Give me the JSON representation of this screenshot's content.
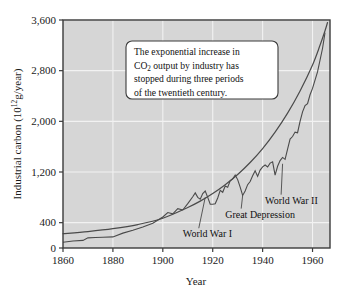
{
  "chart_data": {
    "type": "line",
    "title": "",
    "xlabel": "Year",
    "ylabel": "Industrial carbon (10^12 g/year)",
    "ylabel_parts": {
      "main": "Industrial carbon (10",
      "exponent": "12",
      "tail": "g/year)"
    },
    "xlim": [
      1860,
      1967
    ],
    "ylim": [
      0,
      3600
    ],
    "grid": true,
    "legend_position": "none",
    "x_ticks": [
      1860,
      1880,
      1900,
      1920,
      1940,
      1960
    ],
    "x_tick_labels": [
      "1860",
      "1880",
      "1900",
      "1920",
      "1940",
      "1960"
    ],
    "y_ticks": [
      0,
      400,
      1200,
      2000,
      2800,
      3600
    ],
    "y_tick_labels": [
      "0",
      "400",
      "1,200",
      "2,000",
      "2,800",
      "3,600"
    ],
    "series": [
      {
        "name": "exponential-trend",
        "style": "smooth",
        "x": [
          1860,
          1870,
          1880,
          1890,
          1900,
          1910,
          1915,
          1920,
          1925,
          1930,
          1935,
          1940,
          1945,
          1950,
          1955,
          1960,
          1963,
          1965,
          1966
        ],
        "values": [
          225,
          260,
          305,
          370,
          470,
          640,
          740,
          860,
          1000,
          1160,
          1350,
          1570,
          1830,
          2130,
          2480,
          2890,
          3200,
          3430,
          3560
        ]
      },
      {
        "name": "measured-industrial-carbon",
        "style": "jagged",
        "x": [
          1860,
          1864,
          1868,
          1870,
          1873,
          1876,
          1880,
          1884,
          1888,
          1892,
          1896,
          1900,
          1902,
          1904,
          1906,
          1908,
          1910,
          1912,
          1913,
          1914,
          1915,
          1916,
          1917,
          1918,
          1919,
          1920,
          1921,
          1922,
          1923,
          1924,
          1925,
          1926,
          1927,
          1928,
          1929,
          1930,
          1931,
          1932,
          1933,
          1934,
          1935,
          1936,
          1937,
          1938,
          1939,
          1940,
          1941,
          1942,
          1943,
          1944,
          1945,
          1946,
          1947,
          1948,
          1949,
          1950,
          1951,
          1952,
          1953,
          1954,
          1955,
          1956,
          1957,
          1958,
          1959,
          1960,
          1962,
          1964,
          1965
        ],
        "values": [
          90,
          110,
          120,
          160,
          165,
          170,
          175,
          235,
          280,
          330,
          390,
          490,
          560,
          540,
          620,
          600,
          700,
          810,
          870,
          800,
          770,
          860,
          900,
          800,
          690,
          690,
          700,
          790,
          910,
          880,
          980,
          960,
          1060,
          1090,
          1150,
          1080,
          960,
          830,
          900,
          1000,
          1050,
          1140,
          1220,
          1130,
          1230,
          1280,
          1310,
          1280,
          1340,
          1360,
          1150,
          1290,
          1380,
          1430,
          1400,
          1560,
          1720,
          1760,
          1830,
          1820,
          2000,
          2150,
          2250,
          2280,
          2420,
          2520,
          2780,
          3150,
          3400
        ]
      }
    ],
    "annotations": [
      {
        "name": "world-war-one",
        "label": "World War I",
        "label_x": 1908,
        "label_y": 170,
        "point_x": 1917,
        "point_y": 800
      },
      {
        "name": "great-depression",
        "label": "Great Depression",
        "label_x": 1925,
        "label_y": 480,
        "point_x": 1932,
        "point_y": 830
      },
      {
        "name": "world-war-two",
        "label": "World War II",
        "label_x": 1941,
        "label_y": 700,
        "point_x": 1948,
        "point_y": 1330
      }
    ],
    "callout": {
      "name": "callout-box",
      "lines": [
        "The exponential increase in",
        "CO2 output by industry has",
        "stopped during three periods",
        "of the twentieth century."
      ],
      "line2_parts": {
        "pre": "CO",
        "sub": "2",
        "post": " output by industry has"
      }
    },
    "colors": {
      "plot_background": "#d6d6d6",
      "gridline": "#f2f2f2",
      "frame": "#3b3b3b",
      "curve": "#4a4a4a",
      "text": "#1a1a1a",
      "callout_background": "#ffffff",
      "page_background": "#ffffff"
    }
  }
}
